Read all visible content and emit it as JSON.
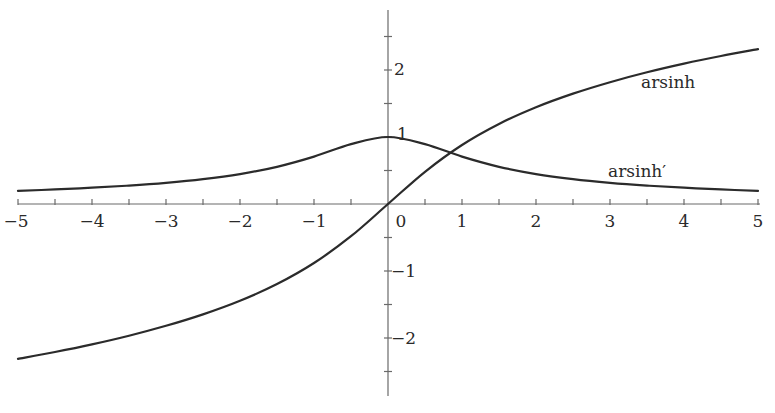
{
  "chart_data": {
    "type": "line",
    "title": "",
    "xlabel": "",
    "ylabel": "",
    "xlim": [
      -5,
      5
    ],
    "ylim": [
      -2.5,
      2.5
    ],
    "grid": false,
    "legend": "inline labels on curves",
    "x_ticks": [
      -5,
      -4,
      -3,
      -2,
      -1,
      0,
      1,
      2,
      3,
      4,
      5
    ],
    "x_tick_labels": [
      "−5",
      "−4",
      "−3",
      "−2",
      "−1",
      "0",
      "1",
      "2",
      "3",
      "4",
      "5"
    ],
    "x_minor_ticks": [
      -4.5,
      -3.5,
      -2.5,
      -1.5,
      -0.5,
      0.5,
      1.5,
      2.5,
      3.5,
      4.5
    ],
    "y_ticks": [
      -2,
      -1,
      1,
      2
    ],
    "y_tick_labels": [
      "−2",
      "−1",
      "1",
      "2"
    ],
    "y_minor_ticks": [
      -2.5,
      -1.5,
      -0.5,
      0.5,
      1.5,
      2.5
    ],
    "x": [
      -5,
      -4.5,
      -4,
      -3.5,
      -3,
      -2.5,
      -2,
      -1.5,
      -1,
      -0.5,
      0,
      0.5,
      1,
      1.5,
      2,
      2.5,
      3,
      3.5,
      4,
      4.5,
      5
    ],
    "series": [
      {
        "name": "arsinh",
        "label": "arsinh",
        "values": [
          -2.312,
          -2.209,
          -2.095,
          -1.966,
          -1.818,
          -1.647,
          -1.444,
          -1.195,
          -0.881,
          -0.481,
          0,
          0.481,
          0.881,
          1.195,
          1.444,
          1.647,
          1.818,
          1.966,
          2.095,
          2.209,
          2.312
        ]
      },
      {
        "name": "arsinh'",
        "label": "arsinh′",
        "values": [
          0.196,
          0.217,
          0.243,
          0.275,
          0.316,
          0.371,
          0.447,
          0.555,
          0.707,
          0.894,
          1,
          0.894,
          0.707,
          0.555,
          0.447,
          0.371,
          0.316,
          0.275,
          0.243,
          0.217,
          0.196
        ]
      }
    ],
    "annotations": [
      {
        "text": "arsinh",
        "near": "arsinh curve, x≈3.5"
      },
      {
        "text": "arsinh′",
        "near": "arsinh' curve, x≈3"
      }
    ]
  },
  "labels": {
    "arsinh": "arsinh",
    "arsinh_prime": "arsinh′",
    "x0": "0",
    "x1": "1",
    "x2": "2",
    "x3": "3",
    "x4": "4",
    "x5": "5",
    "xm1": "−1",
    "xm2": "−2",
    "xm3": "−3",
    "xm4": "−4",
    "xm5": "−5",
    "y1": "1",
    "y2": "2",
    "ym1": "−1",
    "ym2": "−2"
  },
  "colors": {
    "curve": "#2b2b2b",
    "axis": "#6a6a6a",
    "background": "#ffffff"
  }
}
